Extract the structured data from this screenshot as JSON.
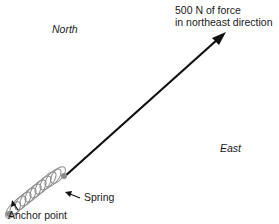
{
  "labels": {
    "north": "North",
    "east": "East",
    "force_line1": "500 N of force",
    "force_line2": "in northeast direction",
    "spring": "Spring",
    "anchor": "Anchor point"
  },
  "colors": {
    "line": "#111111",
    "spring": "#888888",
    "dot": "#8a8a8a"
  },
  "force": {
    "magnitude": "500 N",
    "direction": "northeast"
  }
}
